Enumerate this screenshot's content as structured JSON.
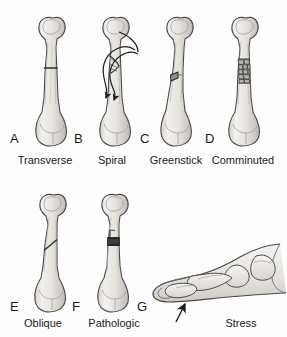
{
  "figure": {
    "background_color": "#fdfdfd",
    "bone_fill": "#e8e6e2",
    "bone_outline": "#4a4a4a",
    "shading_color": "#b9b6b1",
    "text_color": "#1a1a1a",
    "fracture_line_color": "#2b2b2b"
  },
  "panels": [
    {
      "id": "a",
      "letter": "A",
      "caption": "Transverse",
      "subject": "femur",
      "fracture_type": "transverse",
      "fracture_description": "single horizontal break straight across the shaft",
      "has_arrows": false
    },
    {
      "id": "b",
      "letter": "B",
      "caption": "Spiral",
      "subject": "femur",
      "fracture_type": "spiral",
      "fracture_description": "helical break with curved torsion arrows wrapping the shaft",
      "has_arrows": true
    },
    {
      "id": "c",
      "letter": "C",
      "caption": "Greenstick",
      "subject": "femur",
      "fracture_type": "greenstick",
      "fracture_description": "incomplete break through one cortex only, bone bends",
      "has_arrows": false
    },
    {
      "id": "d",
      "letter": "D",
      "caption": "Comminuted",
      "subject": "femur",
      "fracture_type": "comminuted",
      "fracture_description": "bone shattered into multiple small fragments",
      "has_arrows": false
    },
    {
      "id": "e",
      "letter": "E",
      "caption": "Oblique",
      "subject": "femur",
      "fracture_type": "oblique",
      "fracture_description": "diagonal break running at an angle across the shaft",
      "has_arrows": false
    },
    {
      "id": "f",
      "letter": "F",
      "caption": "Pathologic",
      "subject": "femur",
      "fracture_type": "pathologic",
      "fracture_description": "break through a dark lesion weakening the bone",
      "has_arrows": false
    },
    {
      "id": "g",
      "letter": "G",
      "caption": "Stress",
      "subject": "foot-lateral-view",
      "fracture_type": "stress",
      "fracture_description": "hairline break in metatarsal indicated by arrow",
      "has_arrows": true
    }
  ]
}
